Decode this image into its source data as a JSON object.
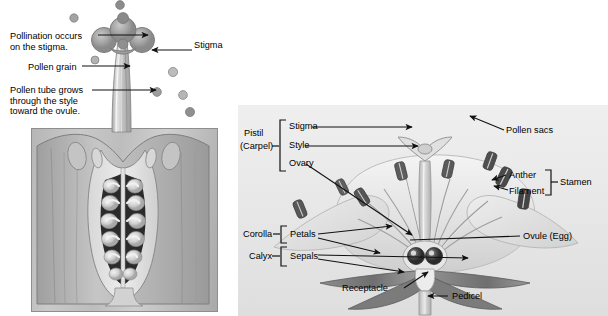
{
  "figure": {
    "title_cutoff": "",
    "left_panel": {
      "name": "pollination-detail",
      "labels": {
        "pollination_occurs": "Pollination occurs\non the stigma.",
        "pollination_occurs_line1": "Pollination occurs",
        "pollination_occurs_line2": "on the stigma.",
        "pollen_grain": "Pollen grain",
        "pollen_tube_line1": "Pollen tube grows",
        "pollen_tube_line2": "through the style",
        "pollen_tube_line3": "toward the ovule.",
        "stigma": "Stigma"
      }
    },
    "right_panel": {
      "name": "flower-anatomy",
      "labels": {
        "pistil": "Pistil",
        "carpel": "(Carpel)",
        "stigma": "Stigma",
        "style": "Style",
        "ovary": "Ovary",
        "corolla": "Corolla",
        "petals": "Petals",
        "calyx": "Calyx",
        "sepals": "Sepals",
        "pollen_sacs": "Pollen sacs",
        "anther": "Anther",
        "filament": "Filament",
        "stamen": "Stamen",
        "ovule_egg": "Ovule (Egg)",
        "receptacle": "Receptacle",
        "pedicel": "Pedicel"
      }
    }
  },
  "colors": {
    "ink": "#000000",
    "line": "#1a1a1a",
    "panel_bg": "#e9e9e9",
    "page_bg": "#ffffff",
    "art_mid": "#bdbdbd",
    "art_dark": "#6f6f6f",
    "art_light": "#dcdcdc"
  }
}
